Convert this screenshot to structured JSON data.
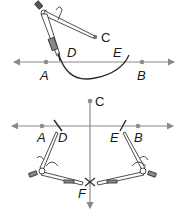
{
  "figures": [
    {
      "name": "step-1-arc-construction",
      "labels": {
        "A": "A",
        "B": "B",
        "C": "C",
        "D": "D",
        "E": "E"
      }
    },
    {
      "name": "step-2-perpendicular-construction",
      "labels": {
        "A": "A",
        "B": "B",
        "C": "C",
        "D": "D",
        "E": "E",
        "F": "F"
      }
    }
  ],
  "colors": {
    "line": "#8a8a8a",
    "point": "#8c8c8c",
    "arc": "#2a2a2a",
    "compass": "#3a3a3a",
    "label": "#1a1a1a"
  }
}
